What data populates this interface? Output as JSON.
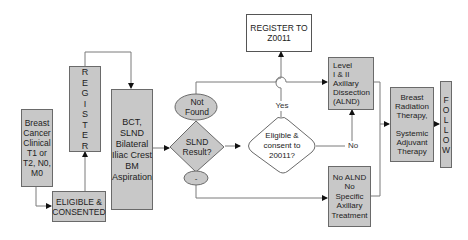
{
  "diagram": {
    "type": "flowchart",
    "nodes": {
      "breast_cancer": {
        "label": "Breast\nCancer\nClinical\nT1 or\nT2, N0,\nM0"
      },
      "eligible_consented": {
        "label": "ELIGIBLE &\nCONSENTED"
      },
      "register": {
        "label": "REGISTER",
        "letters": [
          "R",
          "E",
          "G",
          "I",
          "S",
          "T",
          "E",
          "R"
        ]
      },
      "bct": {
        "label": "BCT,\nSLND\nBilateral\nIliac Crest\nBM\nAspiration"
      },
      "not_found": {
        "label": "Not\nFound"
      },
      "slnd_result": {
        "label": "SLND\nResult?"
      },
      "negative": {
        "label": "-"
      },
      "register_z0011": {
        "label": "REGISTER TO\nZ0011"
      },
      "eligible_z0011": {
        "label": "Eligible &\nconsent to\n20011?"
      },
      "alnd": {
        "label": "Level\nI & II\nAxillary\nDissection\n(ALND)"
      },
      "no_alnd": {
        "label": "No ALND\nNo\nSpecific\nAxillary\nTreatment"
      },
      "radiation": {
        "label": "Breast\nRadiation\nTherapy,\n\nSystemic\nAdjuvant\nTherapy"
      },
      "follow": {
        "label": "FOLLOW",
        "letters": [
          "F",
          "O",
          "L",
          "L",
          "O",
          "W"
        ]
      }
    },
    "edge_labels": {
      "yes": "Yes",
      "no": "No"
    },
    "colors": {
      "box_fill": "#c8c8c8",
      "box_border": "#6a6a6a",
      "line": "#777777",
      "arrow": "#111111"
    }
  }
}
